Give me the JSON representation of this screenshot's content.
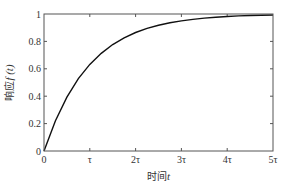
{
  "chart_data": {
    "type": "line",
    "title": "",
    "xlabel": "时间",
    "xlabel_var": "t",
    "ylabel": "响应",
    "ylabel_var": "f (t)",
    "xlim": [
      0,
      5
    ],
    "ylim": [
      0,
      1
    ],
    "grid": false,
    "x_ticks": [
      0,
      1,
      2,
      3,
      4,
      5
    ],
    "x_tick_labels": [
      "0",
      "τ",
      "2τ",
      "3τ",
      "4τ",
      "5τ"
    ],
    "y_ticks": [
      0,
      0.2,
      0.4,
      0.6,
      0.8,
      1
    ],
    "y_tick_labels": [
      "0",
      "0.2",
      "0.4",
      "0.6",
      "0.8",
      "1"
    ],
    "series": [
      {
        "name": "f(t) = 1 - e^(-t/τ)",
        "x": [
          0,
          0.25,
          0.5,
          0.75,
          1,
          1.25,
          1.5,
          1.75,
          2,
          2.25,
          2.5,
          2.75,
          3,
          3.25,
          3.5,
          3.75,
          4,
          4.25,
          4.5,
          4.75,
          5
        ],
        "y": [
          0,
          0.221,
          0.393,
          0.528,
          0.632,
          0.713,
          0.777,
          0.826,
          0.865,
          0.895,
          0.918,
          0.936,
          0.95,
          0.961,
          0.97,
          0.976,
          0.982,
          0.986,
          0.989,
          0.991,
          0.993
        ],
        "color": "#111111"
      }
    ]
  }
}
